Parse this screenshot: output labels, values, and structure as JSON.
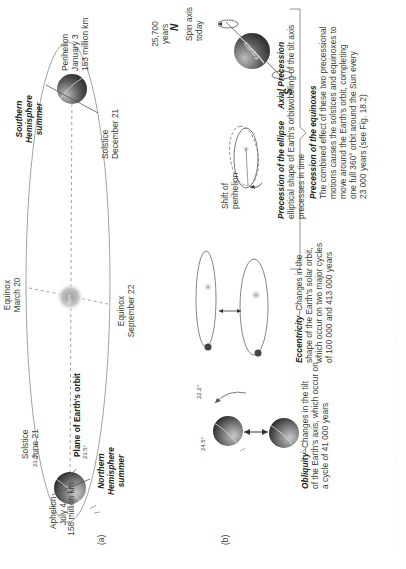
{
  "figure": {
    "panel_a_label": "(a)",
    "panel_b_label": "(b)",
    "panel_a": {
      "sun_label": "Sun",
      "plane_label": "Plane of Earth's orbit",
      "aphelion": {
        "title": "Aphelion",
        "date": "July 4",
        "distance": "158 million km"
      },
      "perihelion": {
        "title": "Perihelion",
        "date": "January 3",
        "distance": "153 million km"
      },
      "solstice_june": {
        "title": "Solstice",
        "date": "June 21",
        "angle": "23.5°"
      },
      "solstice_december": {
        "title": "Solstice",
        "date": "December 21"
      },
      "equinox_march": {
        "title": "Equinox",
        "date": "March 20"
      },
      "equinox_september": {
        "title": "Equinox",
        "date": "September 22"
      },
      "plane_angle": "23.5°",
      "northern_summer": [
        "Northern",
        "Hemisphere",
        "summer"
      ],
      "southern_summer": [
        "Southern",
        "Hemisphere",
        "summer"
      ]
    },
    "panel_b": {
      "obliquity": {
        "angle_min": "22.2°",
        "angle_max": "24.5°",
        "title": "Obliquity",
        "lines": [
          "–Changes in the tilt",
          "of the Earth's axis, which occur on",
          "a cycle of 41 000 years"
        ]
      },
      "eccentricity": {
        "title": "Eccentricity",
        "lines": [
          "–Changes in the",
          "shape of the Earth's solar orbit,",
          "which occur on two major cycles",
          "of 100 000 and 413 000 years"
        ]
      },
      "precession_ellipse": {
        "shift_label": [
          "Shift of",
          "perihelion"
        ],
        "title": "Precession of the ellipse",
        "lines": [
          "elliptical shape of Earth's orbit",
          "precesses in time"
        ]
      },
      "axial_precession": {
        "period": [
          "25,700",
          "years"
        ],
        "north": "N",
        "south": "S",
        "spin_axis": [
          "Spin axis",
          "today"
        ],
        "equator_label": "Equator",
        "title": "Axial Precession",
        "lines": [
          "wobbling of the tilt axis"
        ]
      },
      "precession_equinoxes": {
        "title": "Precession of the equinoxes",
        "lines": [
          "The combined effect of these two precessional",
          "motions causes the solstices and equinoxes to",
          "move around the Earth's orbit, completing",
          "one full 360° orbit around the Sun every",
          "23 000 years (see Fig. 18.2)"
        ]
      }
    },
    "caption_faint": "· · · · · · · · · · · · · · · · · · · · · · · · · · · · · · · · · · · · · · ·"
  },
  "colors": {
    "line": "#8a8a8a",
    "earth_dark": "#2a2a2a",
    "earth_light": "#b9b9b9",
    "sun": "#b0b0b0",
    "text": "#3a3a3a"
  }
}
